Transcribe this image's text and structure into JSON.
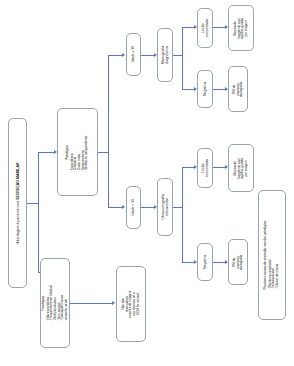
{
  "diagram": {
    "orientation": "rotated-90",
    "accent_color": "#5b77b5",
    "border_color": "#9aa3b0",
    "background": "#ffffff"
  },
  "nodes": {
    "root": {
      "id": "root",
      "text_prefix": "Abordagem à paciente com ",
      "text_emphasis": "SECREÇÃO MAMILAR"
    },
    "patologica": {
      "heading": "Patológica",
      "items": [
        "Espontânea",
        "Unilateral",
        "Ducto único",
        "Sanguinolenta",
        "Serosa ou sanguinolenta"
      ]
    },
    "fisiologica": {
      "heading": "Fisiológica",
      "items": [
        "Não espontânea",
        "Frequentemente bilateral",
        "Múltiplos ductos",
        "Sem sangue",
        "Coloração branca,",
        "amarela, verde"
      ]
    },
    "idade_maior": {
      "label": "Idade ≥ 30"
    },
    "idade_menor": {
      "label": "Idade < 30"
    },
    "mamografia": {
      "label": "Mamografia diagnóstica"
    },
    "ultrassonografia": {
      "label": "Ultrassonografia retroareolar"
    },
    "lesao_sup": {
      "label": "Lesão encontrada"
    },
    "negativa_sup": {
      "label": "Negativa"
    },
    "lesao_inf": {
      "label": "Lesão encontrada"
    },
    "negativa_inf": {
      "label": "Negativa"
    },
    "biopsia_sup": {
      "label": "Biopsia de fragmento com agulha, guiada por imagem"
    },
    "rm_sup": {
      "label": "RM da mama ou ductografia"
    },
    "biopsia_inf": {
      "label": "Biopsia de fragmento com agulha, guiada por imagem"
    },
    "rm_inf": {
      "label": "RM da mama ou ductografia"
    },
    "sem_exames": {
      "label": "Não são necessários exames de imagem nos retornos se o ECM for normal"
    },
    "causas": {
      "heading": "Possíveis causas de secreção mamilar patológica:",
      "items": [
        "Papiloma intraductal",
        "Ectasia ductal",
        "Câncer de mama"
      ]
    }
  }
}
